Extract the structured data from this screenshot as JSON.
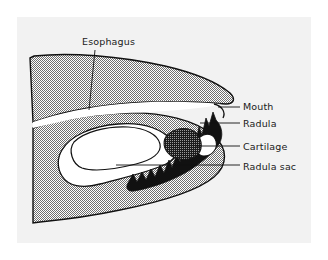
{
  "figure": {
    "panel": {
      "background_color": "#f2f2f2",
      "border_color": "#e4e4e4"
    },
    "colors": {
      "tissue_fill": "#b3b3b3",
      "tissue_stipple": "#8c8c8c",
      "cavity_fill": "#ffffff",
      "radula_teeth": "#111111",
      "cartilage_fill": "#2b2b2b",
      "outline": "#111111",
      "label_text": "#1a1a1a",
      "leader_line": "#111111"
    },
    "labels": [
      {
        "id": "esophagus",
        "text": "Esophagus",
        "text_x": 82,
        "text_y": 45,
        "anchor": "start",
        "leader": "M 95 50 L 89 110",
        "leader_style": "vertical"
      },
      {
        "id": "mouth",
        "text": "Mouth",
        "text_x": 243,
        "text_y": 110,
        "anchor": "start",
        "leader": "M 218 107 L 240 107",
        "leader_style": "horizontal"
      },
      {
        "id": "radula",
        "text": "Radula",
        "text_x": 243,
        "text_y": 127,
        "anchor": "start",
        "leader": "M 200 123 L 240 123",
        "leader_style": "horizontal"
      },
      {
        "id": "cartilage",
        "text": "Cartilage",
        "text_x": 243,
        "text_y": 150,
        "anchor": "start",
        "leader": "M 196 146 L 240 146",
        "leader_style": "horizontal"
      },
      {
        "id": "radula-sac",
        "text": "Radula sac",
        "text_x": 243,
        "text_y": 170,
        "anchor": "start",
        "leader": "M 116 165 L 240 165",
        "leader_style": "horizontal"
      }
    ],
    "structures": [
      {
        "id": "head-tissue",
        "name": "head tissue mass",
        "fill": "stipple-gray"
      },
      {
        "id": "buccal-cavity",
        "name": "buccal cavity and esophagus channel",
        "fill": "white"
      },
      {
        "id": "radula-band",
        "name": "radula toothed ribbon",
        "fill": "black"
      },
      {
        "id": "cartilage-blob",
        "name": "odontophore cartilage",
        "fill": "dark-stipple"
      },
      {
        "id": "radula-sac",
        "name": "radula sac",
        "fill": "white"
      }
    ]
  }
}
